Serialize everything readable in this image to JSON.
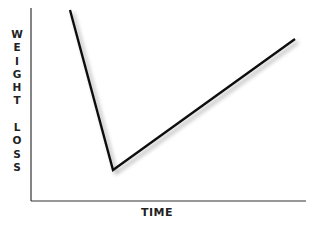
{
  "chart_data": {
    "type": "line",
    "title": "",
    "xlabel": "TIME",
    "ylabel": "WEIGHT LOSS",
    "ylabel_letters": [
      "W",
      "E",
      "I",
      "G",
      "H",
      "T",
      "",
      "L",
      "O",
      "S",
      "S"
    ],
    "grid": false,
    "legend": null,
    "x_ticks": [],
    "y_ticks": [],
    "series": [
      {
        "name": "weight loss",
        "color": "#111111",
        "points_px": [
          [
            70,
            10
          ],
          [
            113,
            170
          ],
          [
            295,
            39
          ]
        ],
        "x": [
          0.14,
          0.3,
          0.96
        ],
        "y": [
          0.99,
          0.16,
          0.84
        ]
      }
    ],
    "axes": {
      "origin_px": [
        31,
        201
      ],
      "x_end_px": 306,
      "y_top_px": 8
    }
  }
}
